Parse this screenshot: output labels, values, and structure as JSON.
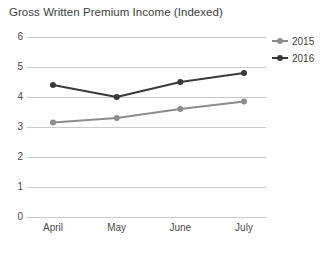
{
  "chart_data": {
    "type": "line",
    "title": "Gross Written Premium Income (Indexed)",
    "xlabel": "",
    "ylabel": "",
    "categories": [
      "April",
      "May",
      "June",
      "July"
    ],
    "series": [
      {
        "name": "2015",
        "values": [
          3.15,
          3.3,
          3.6,
          3.85
        ],
        "color": "#8c8c8c"
      },
      {
        "name": "2016",
        "values": [
          4.4,
          4.0,
          4.5,
          4.8
        ],
        "color": "#3a3a3a"
      }
    ],
    "ylim": [
      0,
      6
    ],
    "yticks": [
      0,
      1,
      2,
      3,
      4,
      5,
      6
    ],
    "ytick_labels": [
      "0",
      "1",
      "2",
      "3",
      "4",
      "5",
      "6"
    ],
    "grid": true,
    "legend_position": "top-right"
  },
  "legend": {
    "items": [
      {
        "label": "2015",
        "color": "#8c8c8c"
      },
      {
        "label": "2016",
        "color": "#3a3a3a"
      }
    ]
  }
}
